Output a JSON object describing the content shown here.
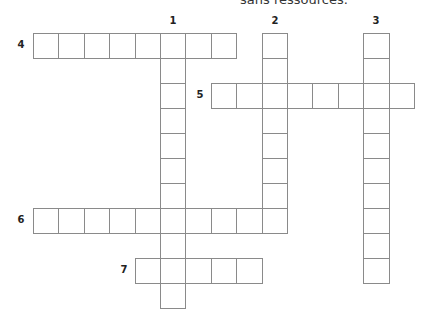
{
  "header": {
    "text": "sans ressources."
  },
  "grid": {
    "origin_x": 33,
    "origin_y": 32.5,
    "cell_w": 25.4,
    "cell_h": 25,
    "border_color": "#8a8a8a"
  },
  "words": [
    {
      "number": "1",
      "direction": "down",
      "col": 5,
      "row": 0,
      "length": 11
    },
    {
      "number": "2",
      "direction": "down",
      "col": 9,
      "row": 0,
      "length": 8
    },
    {
      "number": "3",
      "direction": "down",
      "col": 13,
      "row": 0,
      "length": 10
    },
    {
      "number": "4",
      "direction": "across",
      "col": 0,
      "row": 0,
      "length": 8
    },
    {
      "number": "5",
      "direction": "across",
      "col": 7,
      "row": 2,
      "length": 8
    },
    {
      "number": "6",
      "direction": "across",
      "col": 0,
      "row": 7,
      "length": 10
    },
    {
      "number": "7",
      "direction": "across",
      "col": 4,
      "row": 9,
      "length": 5
    }
  ],
  "labels": {
    "n1": "1",
    "n2": "2",
    "n3": "3",
    "n4": "4",
    "n5": "5",
    "n6": "6",
    "n7": "7"
  }
}
